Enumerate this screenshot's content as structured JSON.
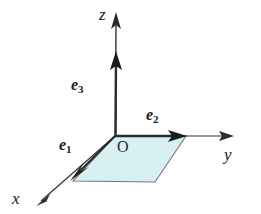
{
  "figure": {
    "background_color": "#ffffff",
    "stroke_color": "#2b2b2b",
    "plane_fill_color": "#d9f0f2",
    "plane_stroke_color": "#5f6a6d",
    "origin": {
      "label": "O",
      "x": 115,
      "y": 136
    },
    "axes": [
      {
        "name": "x-axis",
        "label": "x",
        "label_x": 12,
        "label_y": 190,
        "from": [
          115,
          136
        ],
        "to": [
          37,
          205
        ],
        "arrowhead": true
      },
      {
        "name": "y-axis",
        "label": "y",
        "label_x": 224,
        "label_y": 146,
        "from": [
          115,
          136
        ],
        "to": [
          233,
          136
        ],
        "arrowhead": true
      },
      {
        "name": "z-axis",
        "label": "z",
        "label_x": 99,
        "label_y": 6,
        "from": [
          115,
          136
        ],
        "to": [
          116,
          13
        ],
        "arrowhead": true
      }
    ],
    "basis_vectors": [
      {
        "name": "e1",
        "label": "e",
        "subscript": "1",
        "label_x": 59,
        "label_y": 137,
        "from": [
          115,
          136
        ],
        "to": [
          72,
          179
        ],
        "along_axis": "x-axis",
        "arrowhead": true
      },
      {
        "name": "e2",
        "label": "e",
        "subscript": "2",
        "label_x": 146,
        "label_y": 107,
        "from": [
          115,
          136
        ],
        "to": [
          186,
          136
        ],
        "along_axis": "y-axis",
        "arrowhead": true
      },
      {
        "name": "e3",
        "label": "e",
        "subscript": "3",
        "label_x": 71,
        "label_y": 77,
        "from": [
          115,
          136
        ],
        "to": [
          116,
          52
        ],
        "along_axis": "z-axis",
        "arrowhead": true
      }
    ],
    "plane": {
      "name": "xy-plane",
      "points": [
        [
          115,
          136
        ],
        [
          186,
          136
        ],
        [
          155,
          182
        ],
        [
          73,
          181
        ]
      ],
      "fill": "#d9f0f2",
      "stroke": "#5f6a6d"
    }
  }
}
